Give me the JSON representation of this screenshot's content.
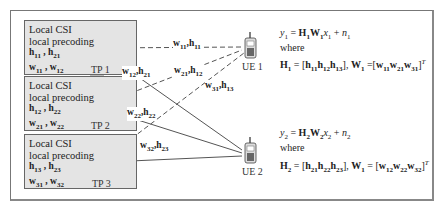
{
  "transmission_points": [
    {
      "id": "TP 1",
      "line1": "Local CSI",
      "line2": "local precoding",
      "channels": "h11 , h21",
      "precoders": "w11 , w12"
    },
    {
      "id": "TP 2",
      "line1": "Local CSI",
      "line2": "local precoding",
      "channels": "h12 , h22",
      "precoders": "w21 , w22"
    },
    {
      "id": "TP 3",
      "line1": "Local CSI",
      "line2": "local precoding",
      "channels": "h13 , h23",
      "precoders": "w31 , w32"
    }
  ],
  "links": [
    {
      "from": "TP 1",
      "to": "UE 1",
      "style": "dashed",
      "label": "w11,h11"
    },
    {
      "from": "TP 1",
      "to": "UE 2",
      "style": "solid",
      "label": "w12,h21"
    },
    {
      "from": "TP 2",
      "to": "UE 1",
      "style": "dashed",
      "label": "w21,h12"
    },
    {
      "from": "TP 2",
      "to": "UE 2",
      "style": "solid",
      "label": "w22,h22"
    },
    {
      "from": "TP 3",
      "to": "UE 1",
      "style": "dashed",
      "label": "w31,h13"
    },
    {
      "from": "TP 3",
      "to": "UE 2",
      "style": "solid",
      "label": "w32,h23"
    }
  ],
  "users": [
    {
      "id": "UE 1",
      "equation": "y1 = H1W1x1 + n1",
      "where": "where",
      "definition": "H1 = [h11h12h13], W1 =[w11w21w31]^T"
    },
    {
      "id": "UE 2",
      "equation": "y2 = H2W2x2 + n2",
      "where": "where",
      "definition": "H2 = [h21h22h23], W1 = [w12w22w32]^T"
    }
  ],
  "colors": {
    "box_fill": "#e4e4e4",
    "border": "#666666",
    "line": "#555555"
  }
}
